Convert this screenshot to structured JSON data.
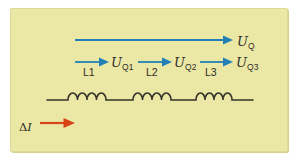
{
  "colors": {
    "page_bg": "#ffffff",
    "panel_bg": "#ebe8a6",
    "blue": "#2280b6",
    "red": "#d84418",
    "line": "#33332a",
    "text": "#2d2d26"
  },
  "diagram": {
    "total_voltage": {
      "symbol": "U",
      "subscript": "Q"
    },
    "branches": [
      {
        "inductor_label": "L1",
        "voltage_symbol": "U",
        "voltage_subscript": "Q1"
      },
      {
        "inductor_label": "L2",
        "voltage_symbol": "U",
        "voltage_subscript": "Q2"
      },
      {
        "inductor_label": "L3",
        "voltage_symbol": "U",
        "voltage_subscript": "Q3"
      }
    ],
    "current": {
      "delta": "Δ",
      "symbol": "I"
    }
  }
}
